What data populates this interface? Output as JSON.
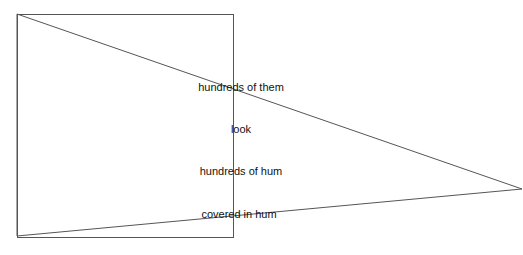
{
  "diagram": {
    "stroke_color": "#555555",
    "rectangle": {
      "x": 17,
      "y": 14,
      "width": 216,
      "height": 223
    },
    "triangle": {
      "points": [
        [
          17,
          14
        ],
        [
          522,
          189
        ],
        [
          17,
          236
        ]
      ]
    },
    "labels": [
      {
        "text": "hundreds of them",
        "x": 241,
        "y": 88
      },
      {
        "text": "look",
        "x": 241,
        "y": 130
      },
      {
        "text": "hundreds of hum",
        "x": 241,
        "y": 172
      },
      {
        "text": "covered in hum",
        "x": 239,
        "y": 215
      }
    ]
  }
}
